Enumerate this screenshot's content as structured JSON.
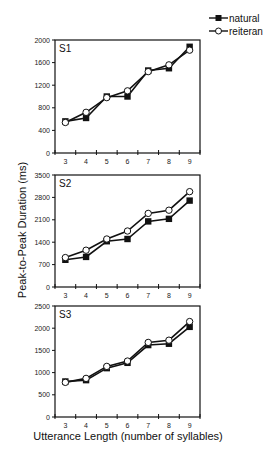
{
  "chart_data": {
    "type": "line",
    "ylabel": "Peak-to-Peak Duration (ms)",
    "xlabel": "Utterance Length (number of syllables)",
    "legend": {
      "position": "top-right",
      "entries": [
        {
          "name": "natural",
          "marker": "filled-square"
        },
        {
          "name": "reiterant",
          "marker": "open-circle"
        }
      ]
    },
    "categories": [
      "3",
      "4",
      "5",
      "6",
      "7",
      "8",
      "9"
    ],
    "panels": [
      {
        "label": "S1",
        "ylim": [
          0,
          2000
        ],
        "yticks": [
          0,
          400,
          800,
          1200,
          1600,
          2000
        ],
        "series": [
          {
            "name": "natural",
            "values": [
              560,
              620,
              1000,
              1000,
              1460,
              1500,
              1880
            ]
          },
          {
            "name": "reiterant",
            "values": [
              540,
              720,
              980,
              1100,
              1440,
              1560,
              1820
            ]
          }
        ]
      },
      {
        "label": "S2",
        "ylim": [
          0,
          3500
        ],
        "yticks": [
          0,
          700,
          1400,
          2100,
          2800,
          3500
        ],
        "series": [
          {
            "name": "natural",
            "values": [
              850,
              940,
              1430,
              1500,
              2050,
              2130,
              2700
            ]
          },
          {
            "name": "reiterant",
            "values": [
              920,
              1150,
              1500,
              1750,
              2300,
              2400,
              2980
            ]
          }
        ]
      },
      {
        "label": "S3",
        "ylim": [
          0,
          2500
        ],
        "yticks": [
          0,
          500,
          1000,
          1500,
          2000,
          2500
        ],
        "series": [
          {
            "name": "natural",
            "values": [
              800,
              830,
              1100,
              1220,
              1620,
              1650,
              2030
            ]
          },
          {
            "name": "reiterant",
            "values": [
              780,
              870,
              1140,
              1260,
              1680,
              1730,
              2150
            ]
          }
        ]
      }
    ],
    "grid": false
  }
}
